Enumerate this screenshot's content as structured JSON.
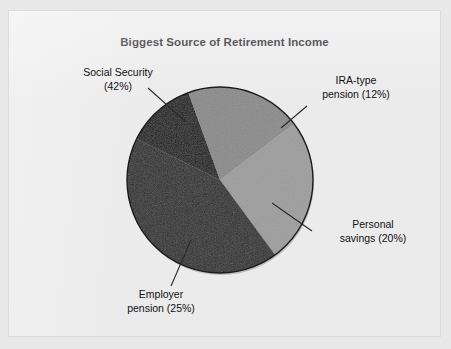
{
  "chart_data": {
    "type": "pie",
    "title": "Biggest Source of Retirement Income",
    "categories": [
      "Social Security",
      "IRA-type pension",
      "Personal savings",
      "Employer pension"
    ],
    "values": [
      42,
      12,
      20,
      25
    ],
    "value_unit": "%",
    "legend": "none",
    "labels": [
      {
        "name": "Social Security",
        "line1": "Social Security",
        "line2": "(42%)",
        "value": 42,
        "color": "#2e2e2e"
      },
      {
        "name": "IRA-type pension",
        "line1": "IRA-type",
        "line2": "pension (12%)",
        "value": 12,
        "color": "#1a1a1a"
      },
      {
        "name": "Personal savings",
        "line1": "Personal",
        "line2": "savings (20%)",
        "value": 20,
        "color": "#8a8a8a"
      },
      {
        "name": "Employer pension",
        "line1": "Employer",
        "line2": "pension (25%)",
        "value": 25,
        "color": "#9d9d9d"
      }
    ],
    "colors": [
      "#2e2e2e",
      "#1a1a1a",
      "#8a8a8a",
      "#9d9d9d"
    ],
    "background": "#ebebeb",
    "xlabel": "",
    "ylabel": ""
  },
  "chart": {
    "title": "Biggest Source of Retirement Income"
  },
  "labels": {
    "social_security": {
      "line1": "Social Security",
      "line2": "(42%)"
    },
    "ira_pension": {
      "line1": "IRA-type",
      "line2": "pension (12%)"
    },
    "personal_savings": {
      "line1": "Personal",
      "line2": "savings (20%)"
    },
    "employer_pension": {
      "line1": "Employer",
      "line2": "pension (25%)"
    }
  }
}
